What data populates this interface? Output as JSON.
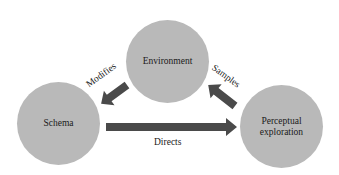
{
  "diagram": {
    "type": "cycle",
    "colors": {
      "node_fill": "#b9b9b9",
      "arrow_fill": "#4a4a4a",
      "text": "#1a1a1a",
      "background": "#ffffff"
    },
    "nodes": [
      {
        "id": "environment",
        "label": "Environment"
      },
      {
        "id": "schema",
        "label": "Schema"
      },
      {
        "id": "perceptual-exploration",
        "label": "Perceptual\nexploration"
      }
    ],
    "edges": [
      {
        "from": "environment",
        "to": "schema",
        "label": "Modifies"
      },
      {
        "from": "schema",
        "to": "perceptual-exploration",
        "label": "Directs"
      },
      {
        "from": "perceptual-exploration",
        "to": "environment",
        "label": "Samples"
      }
    ]
  }
}
